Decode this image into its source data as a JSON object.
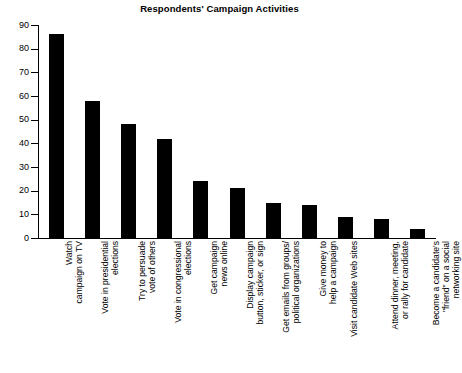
{
  "chart_data": {
    "type": "bar",
    "title": "Respondents' Campaign Activities",
    "xlabel": "",
    "ylabel": "",
    "ylim": [
      0,
      90
    ],
    "ytick_step": 10,
    "yticks": [
      0,
      10,
      20,
      30,
      40,
      50,
      60,
      70,
      80,
      90
    ],
    "ytick_labels": [
      "0",
      "10",
      "20",
      "30",
      "40",
      "50",
      "60",
      "70",
      "80",
      "90"
    ],
    "grid": false,
    "legend": false,
    "bar_color": "#000000",
    "categories": [
      "Watch\ncampaign on TV",
      "Vote in presidential\nelections",
      "Try to persuade\nvote of others",
      "Vote in congressional\nelections",
      "Get campaign\nnews online",
      "Display campaign\nbutton, sticker, or sign",
      "Get emails from groups/\npolitical organizations",
      "Give money to\nhelp a campaign",
      "Visit candidate Web sites",
      "Attend dinner, meeting,\nor rally for candidate",
      "Become a candidate's\n\"friend\" on a social\nnetworking site"
    ],
    "values": [
      86,
      58,
      48,
      42,
      24,
      21,
      15,
      14,
      9,
      8,
      4
    ]
  },
  "axis": {
    "y_min": 0,
    "y_max": 90
  }
}
